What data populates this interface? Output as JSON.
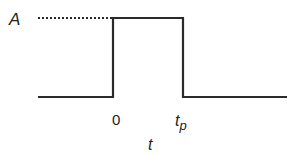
{
  "diagram": {
    "type": "rectangular-pulse",
    "amplitude_label": "A",
    "start_label": "0",
    "end_label": "t",
    "end_label_sub": "p",
    "axis_label": "t",
    "line_color": "#2a2a2a"
  }
}
